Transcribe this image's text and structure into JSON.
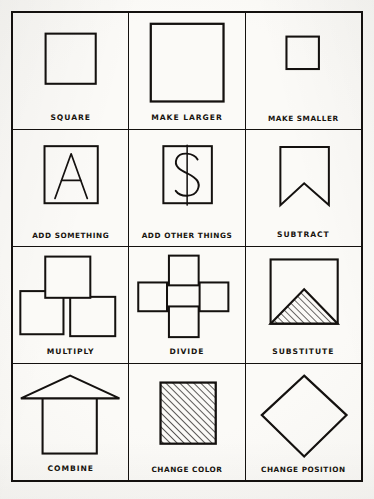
{
  "sheet": {
    "background_color": "#f7f6f2",
    "ink_color": "#14110f",
    "columns": 3,
    "rows": 4,
    "total_cells": 12
  },
  "cells": [
    {
      "index": 1,
      "caption": "SQUARE",
      "figure": "square-medium",
      "figure_description": "A single medium outlined square centered in the cell"
    },
    {
      "index": 2,
      "caption": "MAKE LARGER",
      "figure": "square-large",
      "figure_description": "A single large outlined square nearly filling the cell"
    },
    {
      "index": 3,
      "caption": "MAKE SMALLER",
      "figure": "square-small",
      "figure_description": "A single small outlined square centered in the cell"
    },
    {
      "index": 4,
      "caption": "ADD SOMETHING",
      "figure": "square-with-letter-a",
      "figure_glyph": "A",
      "figure_description": "A square containing the letter A"
    },
    {
      "index": 5,
      "caption": "ADD OTHER THINGS",
      "figure": "square-with-dollar-sign",
      "figure_glyph": "$",
      "figure_description": "A square containing a dollar sign"
    },
    {
      "index": 6,
      "caption": "SUBTRACT",
      "figure": "square-notched-banner",
      "figure_description": "A square with a V notch removed from its bottom edge, forming a banner"
    },
    {
      "index": 7,
      "caption": "MULTIPLY",
      "figure": "three-overlapping-squares",
      "figure_description": "Three squares: one upper center overlapping two lower squares"
    },
    {
      "index": 8,
      "caption": "DIVIDE",
      "figure": "four-separated-squares",
      "figure_description": "Four small squares arranged in a plus or diamond formation"
    },
    {
      "index": 9,
      "caption": "SUBSTITUTE",
      "figure": "square-with-hatched-triangle",
      "figure_description": "A square with a diagonally hatched triangle filling its lower portion"
    },
    {
      "index": 10,
      "caption": "COMBINE",
      "figure": "square-with-triangle-roof",
      "figure_description": "A square topped by a wide triangular roof, house-like"
    },
    {
      "index": 11,
      "caption": "CHANGE COLOR",
      "figure": "square-hatched-fill",
      "figure_description": "A square completely filled with diagonal hatch lines"
    },
    {
      "index": 12,
      "caption": "CHANGE POSITION",
      "figure": "square-rotated-diamond",
      "figure_description": "A square rotated 45 degrees to form a diamond"
    }
  ]
}
